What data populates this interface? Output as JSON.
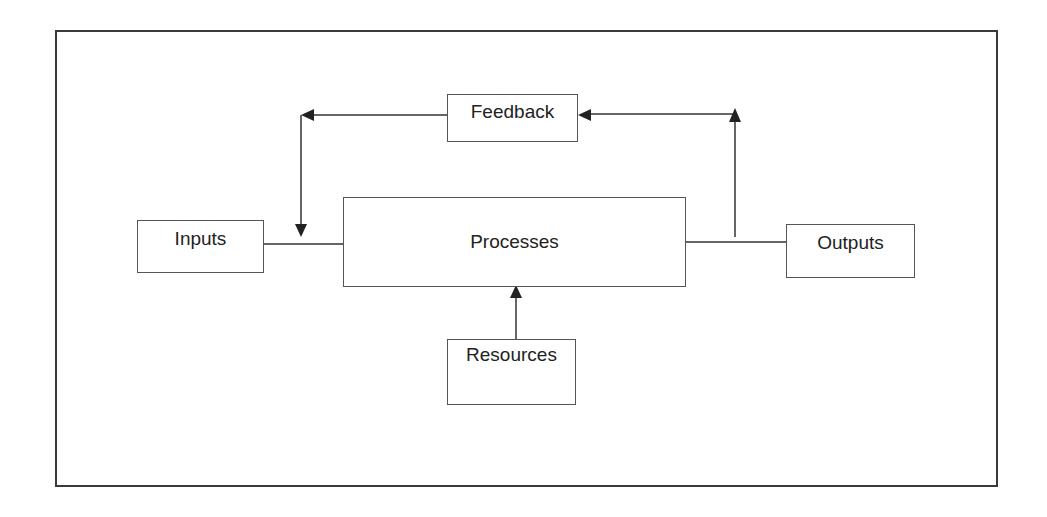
{
  "diagram": {
    "nodes": {
      "feedback": {
        "label": "Feedback"
      },
      "inputs": {
        "label": "Inputs"
      },
      "processes": {
        "label": "Processes"
      },
      "outputs": {
        "label": "Outputs"
      },
      "resources": {
        "label": "Resources"
      }
    },
    "edges": [
      {
        "from": "inputs",
        "to": "processes",
        "type": "line"
      },
      {
        "from": "processes",
        "to": "outputs",
        "type": "line"
      },
      {
        "from": "outputs-connector",
        "to": "feedback",
        "type": "arrow"
      },
      {
        "from": "feedback",
        "to": "inputs-connector",
        "type": "arrow"
      },
      {
        "from": "resources",
        "to": "processes",
        "type": "arrow"
      }
    ],
    "colors": {
      "line": "#333333",
      "border": "#555555",
      "text": "#222222",
      "background": "#ffffff"
    }
  }
}
